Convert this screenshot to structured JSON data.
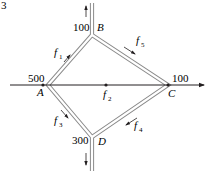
{
  "figure_number": "3",
  "nodes": {
    "A": {
      "label": "A",
      "value": "500",
      "x": 48,
      "y": 85
    },
    "B": {
      "label": "B",
      "value": "100",
      "x": 92,
      "y": 35
    },
    "C": {
      "label": "C",
      "value": "100",
      "x": 168,
      "y": 85
    },
    "D": {
      "label": "D",
      "value": "300",
      "x": 92,
      "y": 137
    }
  },
  "flows": {
    "f1": {
      "base": "f",
      "sub": "1"
    },
    "f2": {
      "base": "f",
      "sub": "2"
    },
    "f3": {
      "base": "f",
      "sub": "3"
    },
    "f4": {
      "base": "f",
      "sub": "4"
    },
    "f5": {
      "base": "f",
      "sub": "5"
    }
  },
  "colors": {
    "line": "#231f20",
    "pipe_outline": "#8a8a8a",
    "pipe_fill": "#ffffff"
  }
}
